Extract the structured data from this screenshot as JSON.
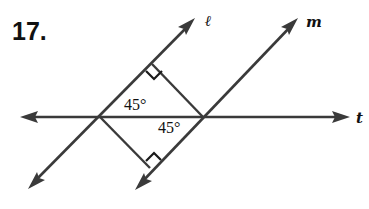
{
  "problem_number": "17.",
  "lines": {
    "l": {
      "label": "ℓ"
    },
    "m": {
      "label": "m"
    },
    "t": {
      "label": "t"
    }
  },
  "angles": {
    "upper": "45°",
    "lower": "45°"
  },
  "right_angle_marks": 2,
  "colors": {
    "stroke": "#3a3a3a",
    "text": "#111111",
    "background": "#ffffff"
  }
}
